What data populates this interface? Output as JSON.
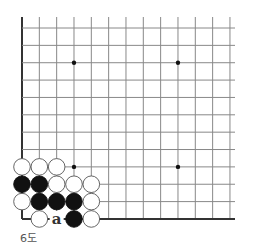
{
  "diagram": {
    "caption": "6도",
    "grid": {
      "columns": 13,
      "rows": 12,
      "origin_x": 22,
      "origin_y": 28,
      "spacing_x": 17.33,
      "spacing_y": 17.36,
      "top_extension_y": 17,
      "right_extension_x": 235,
      "edges": [
        "left",
        "bottom"
      ],
      "line_color": "#888888",
      "edge_color": "#333333"
    },
    "star_points": [
      {
        "col": 3,
        "row": 2
      },
      {
        "col": 9,
        "row": 2
      },
      {
        "col": 3,
        "row": 8
      },
      {
        "col": 9,
        "row": 8
      }
    ],
    "stones": [
      {
        "col": 0,
        "row": 8,
        "color": "white"
      },
      {
        "col": 1,
        "row": 8,
        "color": "white"
      },
      {
        "col": 2,
        "row": 8,
        "color": "white"
      },
      {
        "col": 0,
        "row": 9,
        "color": "black"
      },
      {
        "col": 1,
        "row": 9,
        "color": "black"
      },
      {
        "col": 2,
        "row": 9,
        "color": "white"
      },
      {
        "col": 3,
        "row": 9,
        "color": "white"
      },
      {
        "col": 4,
        "row": 9,
        "color": "white"
      },
      {
        "col": 0,
        "row": 10,
        "color": "white"
      },
      {
        "col": 1,
        "row": 10,
        "color": "black"
      },
      {
        "col": 2,
        "row": 10,
        "color": "black"
      },
      {
        "col": 3,
        "row": 10,
        "color": "black"
      },
      {
        "col": 4,
        "row": 10,
        "color": "white"
      },
      {
        "col": 1,
        "row": 11,
        "color": "white"
      },
      {
        "col": 3,
        "row": 11,
        "color": "black"
      },
      {
        "col": 4,
        "row": 11,
        "color": "white"
      }
    ],
    "labels": [
      {
        "col": 2,
        "row": 11,
        "text": "a"
      }
    ]
  }
}
